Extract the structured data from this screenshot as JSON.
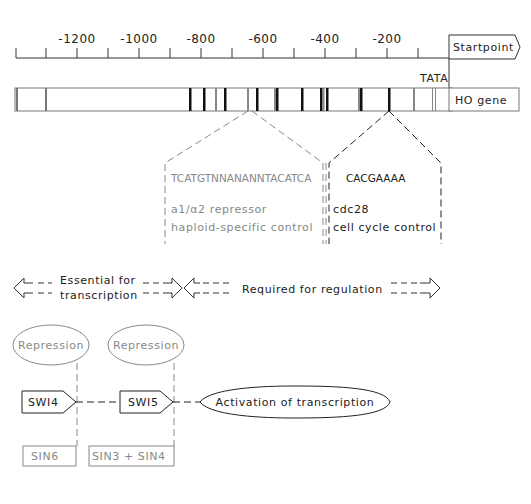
{
  "axis": {
    "tick_labels": [
      "-1200",
      "-1000",
      "-800",
      "-600",
      "-400",
      "-200"
    ],
    "startpoint_label": "Startpoint",
    "tata_label": "TATA"
  },
  "gene": {
    "label": "HO gene"
  },
  "elements": {
    "left": {
      "sequence": "TCATGTNNANANNTACATCA",
      "line1": "a1/α2 repressor",
      "line2": "haploid-specific control"
    },
    "right": {
      "sequence": "CACGAAAA",
      "line1": "cdc28",
      "line2": "cell cycle control"
    }
  },
  "regions": {
    "essential_line1": "Essential for",
    "essential_line2": "transcription",
    "regulation": "Required for regulation"
  },
  "pathway": {
    "repression_left": "Repression",
    "repression_right": "Repression",
    "swi4": "SWI4",
    "swi5": "SWI5",
    "activation": "Activation of transcription",
    "sin6": "SIN6",
    "sin3_sin4": "SIN3 + SIN4"
  },
  "colors": {
    "dark": "#222222",
    "gray": "#888888"
  }
}
